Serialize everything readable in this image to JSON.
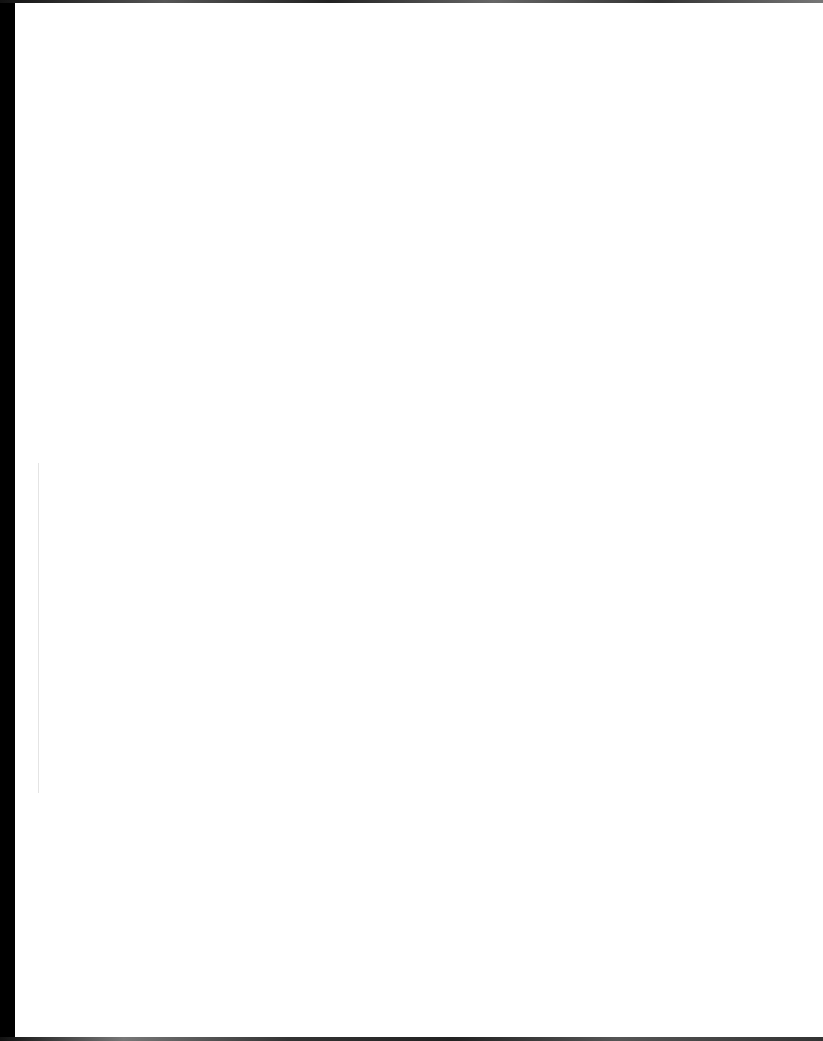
{
  "document": {
    "type": "scanned page",
    "content": "",
    "is_blank": true
  }
}
